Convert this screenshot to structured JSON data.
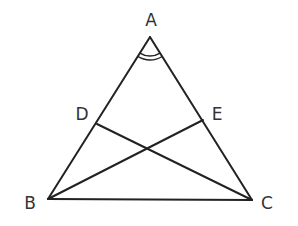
{
  "diagram": {
    "type": "geometry",
    "stroke_color": "#222222",
    "label_color": "#333333",
    "points": {
      "A": {
        "label": "A",
        "x": 150,
        "y": 37,
        "label_x": 151,
        "label_y": 20
      },
      "B": {
        "label": "B",
        "x": 48,
        "y": 199,
        "label_x": 30,
        "label_y": 203
      },
      "C": {
        "label": "C",
        "x": 252,
        "y": 200,
        "label_x": 267,
        "label_y": 203
      },
      "D": {
        "label": "D",
        "x": 97,
        "y": 124,
        "label_x": 82,
        "label_y": 114
      },
      "E": {
        "label": "E",
        "x": 203,
        "y": 120,
        "label_x": 217,
        "label_y": 114
      }
    },
    "segments": [
      {
        "from": "A",
        "to": "B"
      },
      {
        "from": "A",
        "to": "C"
      },
      {
        "from": "B",
        "to": "C"
      },
      {
        "from": "D",
        "to": "C"
      },
      {
        "from": "E",
        "to": "B"
      }
    ],
    "angle_marks": [
      {
        "vertex": "A",
        "count": 2,
        "radii": [
          19,
          23
        ]
      }
    ]
  }
}
